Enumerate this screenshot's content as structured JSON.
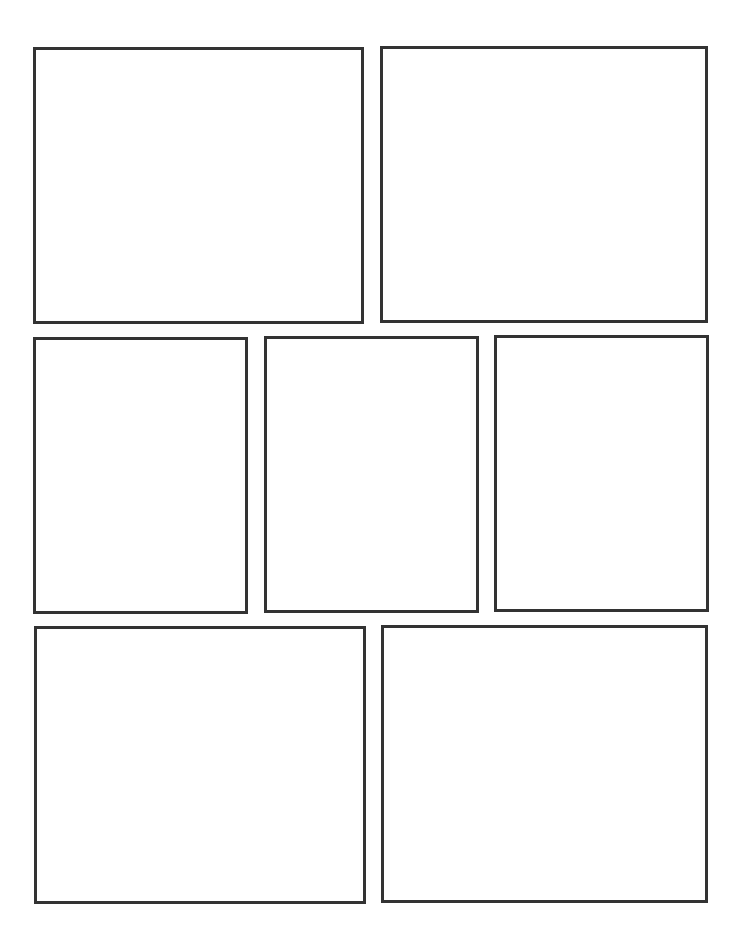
{
  "page": {
    "type": "comic-page-template",
    "background_color": "#ffffff",
    "border_color": "#333333",
    "rows": 3,
    "panel_count": 7
  },
  "panels": [
    {
      "id": 1,
      "row": 1,
      "content": ""
    },
    {
      "id": 2,
      "row": 1,
      "content": ""
    },
    {
      "id": 3,
      "row": 2,
      "content": ""
    },
    {
      "id": 4,
      "row": 2,
      "content": ""
    },
    {
      "id": 5,
      "row": 2,
      "content": ""
    },
    {
      "id": 6,
      "row": 3,
      "content": ""
    },
    {
      "id": 7,
      "row": 3,
      "content": ""
    }
  ]
}
